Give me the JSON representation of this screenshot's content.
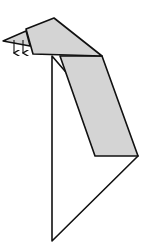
{
  "diagram": {
    "title": "",
    "colors": {
      "background": "#ffffff",
      "stroke": "#111111",
      "fill_gray": "#d4d4d4"
    },
    "shapes": {
      "head": "26,29 54,18 102,56 33,54",
      "beak": "3,41 26,31 30,46",
      "body_gray": "60,56 102,56 138,156 95,156",
      "lower_triangle": "52,56 52,241 138,156"
    },
    "arrows": [
      {
        "x": 14,
        "y1": 40,
        "y2": 53
      },
      {
        "x": 23,
        "y1": 40,
        "y2": 53
      }
    ]
  }
}
